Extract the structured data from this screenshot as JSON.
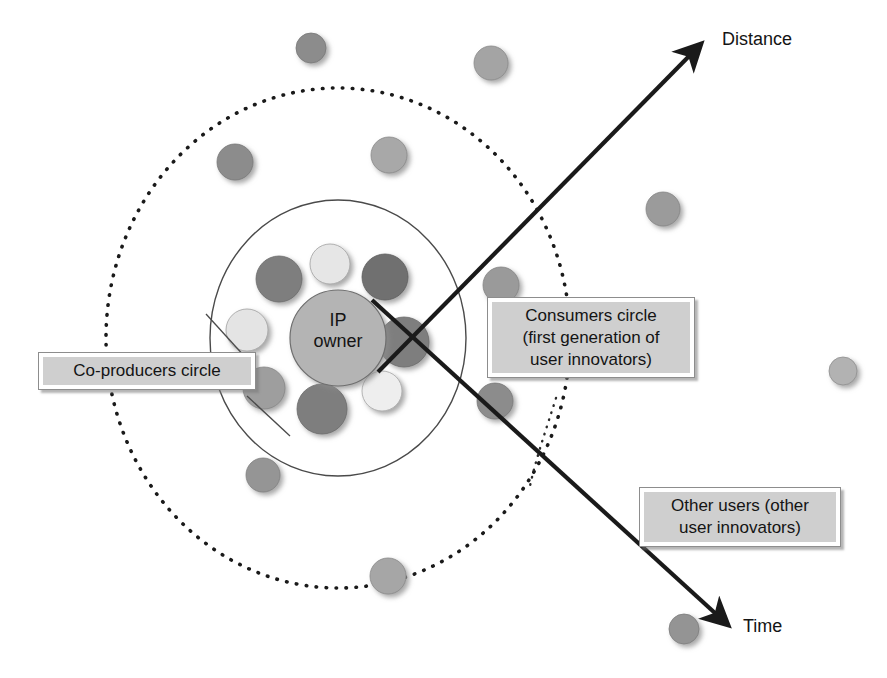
{
  "diagram": {
    "background": "#ffffff"
  },
  "center_node": {
    "label": "IP\nowner",
    "cx": 338,
    "cy": 338,
    "r": 48,
    "fill": "#b4b4b4",
    "stroke": "#6e6e6e"
  },
  "rings": [
    {
      "name": "co-producers-ring",
      "style": "solid",
      "cx": 338,
      "cy": 338,
      "rx": 128,
      "ry": 138,
      "stroke": "#4a4a4a",
      "stroke_width": 1.4
    },
    {
      "name": "consumers-ring",
      "style": "dotted",
      "cx": 338,
      "cy": 338,
      "rx": 232,
      "ry": 250,
      "stroke": "#1a1a1a",
      "stroke_width": 3.5
    }
  ],
  "colors": {
    "dot_dark": "#7e7e7e",
    "dot_mid": "#9e9e9e",
    "dot_light": "#e6e6e6",
    "center_fill": "#b4b4b4",
    "callout_fill": "#cfcfcf",
    "callout_border": "#8d8d8d",
    "arrow": "#1a1a1a",
    "text": "#141414"
  },
  "inner_dots": [
    {
      "name": "co-producer-dot-1",
      "cx": 279,
      "cy": 279,
      "r": 23,
      "fill": "#7e7e7e"
    },
    {
      "name": "co-producer-dot-2",
      "cx": 330,
      "cy": 264,
      "r": 20,
      "fill": "#e6e6e6"
    },
    {
      "name": "co-producer-dot-3",
      "cx": 385,
      "cy": 277,
      "r": 23,
      "fill": "#6f6f6f"
    },
    {
      "name": "co-producer-dot-4",
      "cx": 404,
      "cy": 342,
      "r": 25,
      "fill": "#7e7e7e"
    },
    {
      "name": "co-producer-dot-5",
      "cx": 382,
      "cy": 391,
      "r": 20,
      "fill": "#eeeeee"
    },
    {
      "name": "co-producer-dot-6",
      "cx": 322,
      "cy": 409,
      "r": 25,
      "fill": "#7e7e7e"
    },
    {
      "name": "co-producer-dot-7",
      "cx": 264,
      "cy": 388,
      "r": 21,
      "fill": "#9e9e9e"
    },
    {
      "name": "co-producer-dot-8",
      "cx": 247,
      "cy": 330,
      "r": 21,
      "fill": "#e4e4e4"
    }
  ],
  "middle_dots": [
    {
      "name": "consumer-dot-1",
      "cx": 235,
      "cy": 162,
      "r": 18,
      "fill": "#8c8c8c"
    },
    {
      "name": "consumer-dot-2",
      "cx": 389,
      "cy": 155,
      "r": 18,
      "fill": "#a8a8a8"
    },
    {
      "name": "consumer-dot-3",
      "cx": 501,
      "cy": 285,
      "r": 18,
      "fill": "#9a9a9a"
    },
    {
      "name": "consumer-dot-4",
      "cx": 495,
      "cy": 401,
      "r": 18,
      "fill": "#8c8c8c"
    },
    {
      "name": "consumer-dot-5",
      "cx": 263,
      "cy": 475,
      "r": 17,
      "fill": "#959595"
    },
    {
      "name": "consumer-dot-6",
      "cx": 388,
      "cy": 576,
      "r": 18,
      "fill": "#a6a6a6"
    }
  ],
  "outer_dots": [
    {
      "name": "other-user-dot-1",
      "cx": 311,
      "cy": 48,
      "r": 15,
      "fill": "#8c8c8c"
    },
    {
      "name": "other-user-dot-2",
      "cx": 491,
      "cy": 63,
      "r": 17,
      "fill": "#a4a4a4"
    },
    {
      "name": "other-user-dot-3",
      "cx": 663,
      "cy": 209,
      "r": 17,
      "fill": "#9b9b9b"
    },
    {
      "name": "other-user-dot-4",
      "cx": 843,
      "cy": 371,
      "r": 14,
      "fill": "#b0b0b0"
    },
    {
      "name": "other-user-dot-5",
      "cx": 684,
      "cy": 629,
      "r": 15,
      "fill": "#949494"
    }
  ],
  "arrows": [
    {
      "name": "distance-arrow",
      "label": "Distance",
      "from": {
        "x": 378,
        "y": 372
      },
      "to": {
        "x": 702,
        "y": 43
      }
    },
    {
      "name": "time-arrow",
      "label": "Time",
      "from": {
        "x": 372,
        "y": 300
      },
      "to": {
        "x": 729,
        "y": 626
      }
    }
  ],
  "leaders": [
    {
      "name": "coproducers-leader-upper",
      "from": {
        "x": 246,
        "y": 358
      },
      "to": {
        "x": 210,
        "y": 318
      }
    },
    {
      "name": "coproducers-leader-lower",
      "from": {
        "x": 246,
        "y": 396
      },
      "to": {
        "x": 286,
        "y": 430
      }
    },
    {
      "name": "consumers-leader",
      "from": {
        "x": 556,
        "y": 400
      },
      "to": {
        "x": 535,
        "y": 450
      }
    }
  ],
  "callouts": {
    "coproducers": {
      "label": "Co-producers circle"
    },
    "consumers": {
      "label": "Consumers circle\n(first generation of\nuser innovators)"
    },
    "other_users": {
      "label": "Other users (other\nuser innovators)"
    }
  },
  "axis_labels": {
    "distance": "Distance",
    "time": "Time"
  }
}
